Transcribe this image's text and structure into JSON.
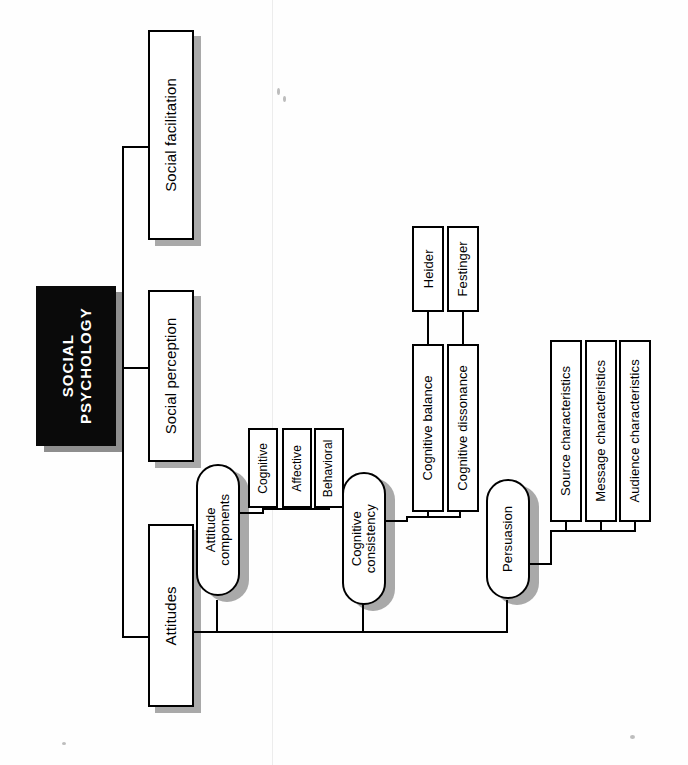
{
  "diagram": {
    "title": "SOCIAL PSYCHOLOGY",
    "orientation": "rotated-90",
    "root": {
      "label": "SOCIAL\nPSYCHOLOGY"
    },
    "level1": [
      {
        "id": "social-facilitation",
        "label": "Social facilitation"
      },
      {
        "id": "social-perception",
        "label": "Social perception"
      },
      {
        "id": "attitudes",
        "label": "Attitudes"
      }
    ],
    "level2": [
      {
        "id": "attitude-components",
        "label": "Attitude\ncomponents",
        "shape": "stadium"
      },
      {
        "id": "cognitive-consistency",
        "label": "Cognitive\nconsistency",
        "shape": "stadium"
      },
      {
        "id": "persuasion",
        "label": "Persuasion",
        "shape": "stadium"
      }
    ],
    "attitude_components_children": [
      {
        "id": "cognitive",
        "label": "Cognitive"
      },
      {
        "id": "affective",
        "label": "Affective"
      },
      {
        "id": "behavioral",
        "label": "Behavioral"
      }
    ],
    "cognitive_consistency_children": [
      {
        "id": "cognitive-balance",
        "label": "Cognitive balance"
      },
      {
        "id": "cognitive-dissonance",
        "label": "Cognitive dissonance"
      }
    ],
    "theorists": [
      {
        "id": "heider",
        "label": "Heider"
      },
      {
        "id": "festinger",
        "label": "Festinger"
      }
    ],
    "persuasion_children": [
      {
        "id": "source-characteristics",
        "label": "Source characteristics"
      },
      {
        "id": "message-characteristics",
        "label": "Message characteristics"
      },
      {
        "id": "audience-characteristics",
        "label": "Audience characteristics"
      }
    ],
    "colors": {
      "background": "#ffffff",
      "stroke": "#000000",
      "root_fill": "#0a0a0a",
      "root_text": "#ffffff",
      "shadow": "#a9a9a9"
    }
  }
}
